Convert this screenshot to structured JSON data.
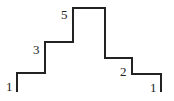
{
  "diagram": {
    "type": "step-profile",
    "stroke_color": "#222222",
    "steps": [
      {
        "label": "1",
        "level": 1
      },
      {
        "label": "3",
        "level": 3
      },
      {
        "label": "5",
        "level": 5
      },
      {
        "label": "2",
        "level": 2
      },
      {
        "label": "1",
        "level": 1
      }
    ]
  }
}
